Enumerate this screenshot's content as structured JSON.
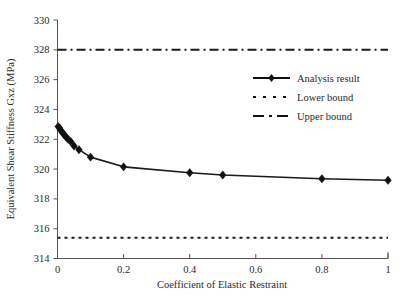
{
  "chart_data": {
    "type": "line",
    "title": "",
    "xlabel": "Coefficient of Elastic Restraint",
    "ylabel": "Equivalent Shear Stiffness Gxz (MPa)",
    "xlim": [
      0,
      1
    ],
    "ylim": [
      314,
      330
    ],
    "xticks": [
      "0",
      "0.2",
      "0.4",
      "0.6",
      "0.8",
      "1"
    ],
    "xtick_values": [
      0,
      0.2,
      0.4,
      0.6,
      0.8,
      1
    ],
    "yticks": [
      "314",
      "316",
      "318",
      "320",
      "322",
      "324",
      "326",
      "328",
      "330"
    ],
    "ytick_values": [
      314,
      316,
      318,
      320,
      322,
      324,
      326,
      328,
      330
    ],
    "grid": false,
    "legend_position": "upper right",
    "series": [
      {
        "name": "Analysis result",
        "style": "solid-with-diamond-markers",
        "x": [
          0.002,
          0.006,
          0.01,
          0.015,
          0.02,
          0.026,
          0.032,
          0.04,
          0.05,
          0.065,
          0.1,
          0.2,
          0.4,
          0.5,
          0.8,
          1.0
        ],
        "y": [
          322.85,
          322.75,
          322.6,
          322.45,
          322.3,
          322.15,
          322.0,
          321.85,
          321.55,
          321.3,
          320.8,
          320.15,
          319.75,
          319.6,
          319.35,
          319.25
        ]
      },
      {
        "name": "Lower bound",
        "style": "dotted",
        "value": 315.4
      },
      {
        "name": "Upper bound",
        "style": "dash-dot",
        "value": 328.0
      }
    ],
    "legend": [
      {
        "label": "Analysis result",
        "style": "solid-with-diamond-markers"
      },
      {
        "label": "Lower bound",
        "style": "dotted"
      },
      {
        "label": "Upper bound",
        "style": "dash-dot"
      }
    ],
    "colors": {
      "series": "#111111",
      "axis": "#555555",
      "background": "#ffffff"
    }
  }
}
